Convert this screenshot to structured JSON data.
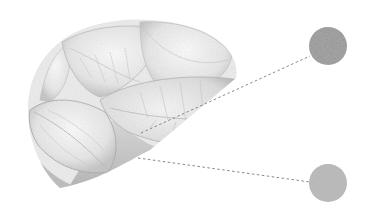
{
  "illustration": {
    "subject": "grayscale leaf cluster in circular crop",
    "background": "#ffffff",
    "leaf_crop": {
      "cx": 128,
      "cy": 108,
      "r": 100,
      "tone_light": "#f4f4f4",
      "tone_mid": "#d6d6d6",
      "tone_dark": "#a8a8a8",
      "vein": "#bdbdbd"
    },
    "callouts": [
      {
        "name": "swatch-top",
        "from": [
          141,
          133
        ],
        "to": [
          310,
          56
        ],
        "cx": 328,
        "cy": 46,
        "r": 19,
        "color": "#999999"
      },
      {
        "name": "swatch-bottom",
        "from": [
          138,
          158
        ],
        "to": [
          310,
          182
        ],
        "cx": 328,
        "cy": 183,
        "r": 19,
        "color": "#b9b9b9"
      }
    ],
    "line_color": "#7a7a7a"
  }
}
